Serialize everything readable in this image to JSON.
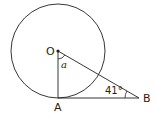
{
  "diagram": {
    "type": "geometry",
    "colors": {
      "stroke": "#231f20",
      "background": "#ffffff"
    },
    "points": {
      "O": {
        "label": "O",
        "x": 58,
        "y": 51
      },
      "A": {
        "label": "A",
        "x": 58,
        "y": 98
      },
      "B": {
        "label": "B",
        "x": 138,
        "y": 98
      }
    },
    "circle": {
      "center": "O",
      "radius": 47
    },
    "segments": [
      "OA",
      "AB",
      "OB"
    ],
    "angles": {
      "at_O": {
        "label": "a",
        "between": [
          "OA",
          "OB"
        ]
      },
      "at_B": {
        "label": "41°",
        "between": [
          "BA",
          "BO"
        ]
      }
    }
  }
}
